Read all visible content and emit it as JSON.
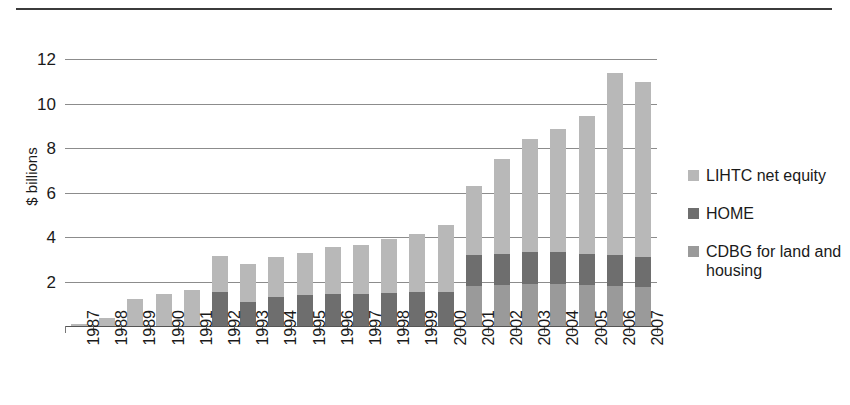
{
  "chart_data": {
    "type": "bar",
    "title": "",
    "subtitle": "",
    "xlabel": "",
    "ylabel": "$ billions",
    "ylim": [
      0,
      12.6
    ],
    "yticks": [
      2,
      4,
      6,
      8,
      10,
      12
    ],
    "ytick_labels": [
      "2",
      "4",
      "6",
      "8",
      "10",
      "12"
    ],
    "grid": true,
    "stacked": true,
    "legend_position": "right",
    "categories": [
      "1987",
      "1988",
      "1989",
      "1990",
      "1991",
      "1992",
      "1993",
      "1994",
      "1995",
      "1996",
      "1997",
      "1998",
      "1999",
      "2000",
      "2001",
      "2002",
      "2003",
      "2004",
      "2005",
      "2006",
      "2007"
    ],
    "series": [
      {
        "name": "CDBG for land and housing",
        "color": "#9a9a9a",
        "values": [
          0,
          0,
          0,
          0,
          0,
          0,
          0,
          0,
          0,
          0,
          0,
          0,
          0,
          0,
          1.8,
          1.85,
          1.9,
          1.9,
          1.85,
          1.8,
          1.75
        ]
      },
      {
        "name": "HOME",
        "color": "#6e6e6e",
        "values": [
          0,
          0,
          0,
          0,
          0,
          1.55,
          1.1,
          1.3,
          1.4,
          1.45,
          1.45,
          1.5,
          1.55,
          1.55,
          1.4,
          1.4,
          1.45,
          1.45,
          1.4,
          1.4,
          1.35
        ]
      },
      {
        "name": "LIHTC net equity",
        "color": "#b8b8b8",
        "values": [
          0.1,
          0.35,
          1.2,
          1.45,
          1.6,
          1.6,
          1.7,
          1.8,
          1.9,
          2.1,
          2.2,
          2.4,
          2.6,
          3.0,
          3.1,
          4.25,
          5.05,
          5.5,
          6.2,
          8.2,
          7.9
        ]
      }
    ],
    "totals": [
      0.1,
      0.35,
      1.2,
      1.45,
      1.6,
      3.15,
      2.8,
      3.1,
      3.3,
      3.55,
      3.65,
      3.9,
      4.15,
      4.55,
      6.3,
      7.5,
      8.4,
      8.85,
      9.45,
      11.4,
      11.0
    ]
  },
  "legend": {
    "items": [
      {
        "label": "LIHTC net equity",
        "color": "#b8b8b8"
      },
      {
        "label": "HOME",
        "color": "#6e6e6e"
      },
      {
        "label": "CDBG for land and housing",
        "color": "#9a9a9a"
      }
    ]
  },
  "axis": {
    "y_title": "$ billions"
  }
}
